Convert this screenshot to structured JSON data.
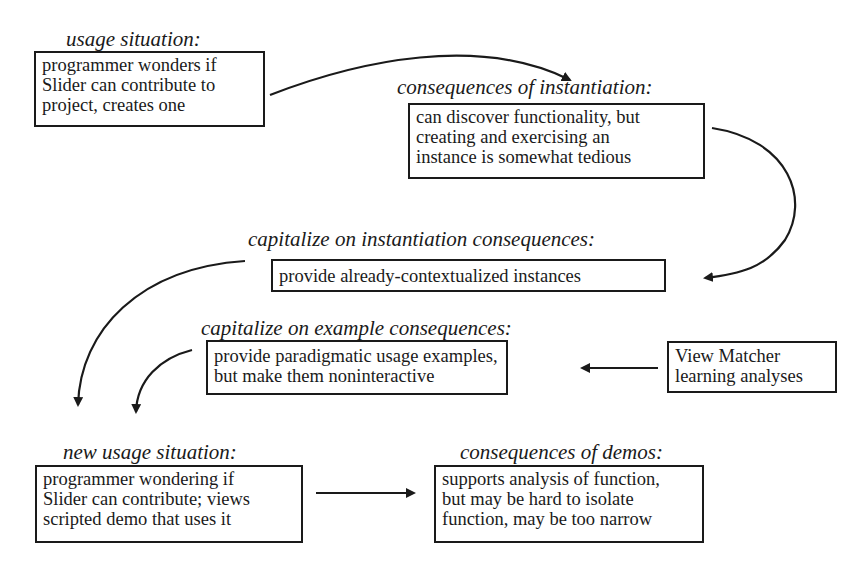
{
  "diagram": {
    "nodes": [
      {
        "id": "usage",
        "heading": "usage situation:",
        "lines": [
          "programmer wonders if",
          "Slider can contribute to",
          "project, creates one"
        ]
      },
      {
        "id": "consequences-instantiation",
        "heading": "consequences of instantiation:",
        "lines": [
          "can discover functionality, but",
          "creating and exercising an",
          "instance is somewhat tedious"
        ]
      },
      {
        "id": "capitalize-instantiation",
        "heading": "capitalize on instantiation consequences:",
        "lines": [
          "provide already-contextualized instances"
        ]
      },
      {
        "id": "capitalize-example",
        "heading": "capitalize on example consequences:",
        "lines": [
          "provide paradigmatic usage examples,",
          "but make them noninteractive"
        ]
      },
      {
        "id": "view-matcher",
        "heading": "",
        "lines": [
          "View Matcher",
          "learning analyses"
        ]
      },
      {
        "id": "new-usage",
        "heading": "new usage situation:",
        "lines": [
          "programmer wondering if",
          "Slider can contribute; views",
          "scripted demo that uses it"
        ]
      },
      {
        "id": "consequences-demos",
        "heading": "consequences of demos:",
        "lines": [
          "supports analysis of function,",
          "but may be hard to isolate",
          "function, may be too narrow"
        ]
      }
    ],
    "edges": [
      {
        "from": "usage",
        "to": "consequences-instantiation"
      },
      {
        "from": "consequences-instantiation",
        "to": "capitalize-instantiation"
      },
      {
        "from": "capitalize-instantiation",
        "to": "new-usage"
      },
      {
        "from": "capitalize-example",
        "to": "new-usage"
      },
      {
        "from": "view-matcher",
        "to": "capitalize-example"
      },
      {
        "from": "new-usage",
        "to": "consequences-demos"
      }
    ],
    "stroke_color": "#1a1a1a"
  }
}
